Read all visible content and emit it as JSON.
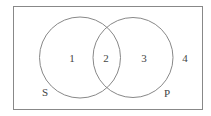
{
  "diagram": {
    "type": "venn",
    "universe": {
      "x": 13,
      "y": 6,
      "width": 189,
      "height": 103,
      "label": ""
    },
    "circles": [
      {
        "name": "S",
        "cx": 80,
        "cy": 57.5,
        "r": 40.5,
        "label": "S",
        "label_x": 45,
        "label_y": 96
      },
      {
        "name": "P",
        "cx": 133,
        "cy": 57.5,
        "r": 40,
        "label": "P",
        "label_x": 167,
        "label_y": 97
      }
    ],
    "regions": [
      {
        "id": "1",
        "label": "1",
        "x": 72,
        "y": 62
      },
      {
        "id": "2",
        "label": "2",
        "x": 106,
        "y": 62
      },
      {
        "id": "3",
        "label": "3",
        "x": 144,
        "y": 62
      },
      {
        "id": "4",
        "label": "4",
        "x": 185,
        "y": 62
      }
    ],
    "stroke_color": "#888888",
    "text_color": "#444444"
  }
}
